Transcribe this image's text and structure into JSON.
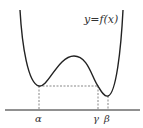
{
  "diagram": {
    "function_label": "y=f(x)",
    "points": [
      {
        "name": "alpha",
        "label": "α"
      },
      {
        "name": "gamma",
        "label": "γ"
      },
      {
        "name": "beta",
        "label": "β"
      }
    ],
    "colors": {
      "curve": "#222222",
      "axis": "#222222",
      "dashed": "#555555",
      "text": "#333333"
    }
  }
}
